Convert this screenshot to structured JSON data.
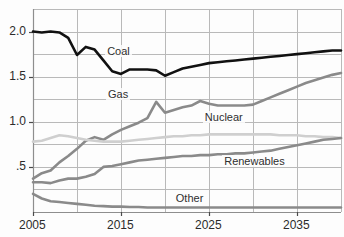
{
  "chart_data": {
    "type": "line",
    "title": "",
    "subtitle": "",
    "xlabel": "",
    "ylabel": "",
    "xlim": [
      2005,
      2040
    ],
    "ylim": [
      0,
      2.25
    ],
    "grid": true,
    "grid_x_step": 5,
    "grid_y_step": 0.25,
    "legend_position": "inline-annotations",
    "x_ticks": [
      2005,
      2015,
      2025,
      2035
    ],
    "x_tick_labels": [
      "2005",
      "2015",
      "2025",
      "2035"
    ],
    "x_minor_gridlines": [
      2010,
      2020,
      2030,
      2040
    ],
    "y_ticks": [
      0.5,
      1.0,
      1.5,
      2.0
    ],
    "y_tick_labels": [
      ".5",
      "1.0",
      "1.5",
      "2.0"
    ],
    "x": [
      2005,
      2006,
      2007,
      2008,
      2009,
      2010,
      2011,
      2012,
      2013,
      2014,
      2015,
      2016,
      2017,
      2018,
      2019,
      2020,
      2021,
      2022,
      2023,
      2024,
      2025,
      2026,
      2027,
      2028,
      2029,
      2030,
      2031,
      2032,
      2033,
      2034,
      2035,
      2036,
      2037,
      2038,
      2039,
      2040
    ],
    "series": [
      {
        "name": "Coal",
        "color": "#111111",
        "width": 2.6,
        "label_x": 2013.2,
        "label_y": 1.79,
        "values": [
          2.0,
          1.99,
          2.0,
          1.99,
          1.93,
          1.74,
          1.83,
          1.8,
          1.68,
          1.56,
          1.53,
          1.58,
          1.58,
          1.58,
          1.57,
          1.51,
          1.55,
          1.59,
          1.61,
          1.63,
          1.65,
          1.66,
          1.67,
          1.68,
          1.69,
          1.7,
          1.71,
          1.72,
          1.73,
          1.74,
          1.75,
          1.76,
          1.77,
          1.78,
          1.79,
          1.79
        ]
      },
      {
        "name": "Gas",
        "color": "#8a8a8a",
        "width": 2.6,
        "label_x": 2013.3,
        "label_y": 1.31,
        "values": [
          0.37,
          0.43,
          0.46,
          0.55,
          0.62,
          0.7,
          0.79,
          0.83,
          0.8,
          0.86,
          0.91,
          0.95,
          0.99,
          1.04,
          1.22,
          1.1,
          1.13,
          1.16,
          1.18,
          1.23,
          1.2,
          1.18,
          1.18,
          1.18,
          1.18,
          1.19,
          1.23,
          1.27,
          1.31,
          1.35,
          1.39,
          1.43,
          1.46,
          1.49,
          1.52,
          1.54
        ]
      },
      {
        "name": "Nuclear",
        "color": "#cfcfcf",
        "width": 2.6,
        "label_x": 2024.3,
        "label_y": 1.05,
        "values": [
          0.78,
          0.79,
          0.82,
          0.85,
          0.84,
          0.82,
          0.8,
          0.79,
          0.78,
          0.78,
          0.78,
          0.79,
          0.8,
          0.81,
          0.82,
          0.83,
          0.84,
          0.84,
          0.85,
          0.85,
          0.86,
          0.86,
          0.86,
          0.86,
          0.86,
          0.86,
          0.86,
          0.86,
          0.85,
          0.85,
          0.85,
          0.84,
          0.84,
          0.83,
          0.83,
          0.82
        ]
      },
      {
        "name": "Renewables",
        "color": "#8a8a8a",
        "width": 2.6,
        "label_x": 2026.5,
        "label_y": 0.57,
        "values": [
          0.33,
          0.33,
          0.32,
          0.35,
          0.37,
          0.37,
          0.39,
          0.42,
          0.5,
          0.51,
          0.53,
          0.55,
          0.57,
          0.58,
          0.59,
          0.6,
          0.61,
          0.62,
          0.62,
          0.63,
          0.63,
          0.64,
          0.64,
          0.65,
          0.65,
          0.66,
          0.67,
          0.68,
          0.7,
          0.72,
          0.74,
          0.76,
          0.78,
          0.8,
          0.81,
          0.82
        ]
      },
      {
        "name": "Other",
        "color": "#8a8a8a",
        "width": 2.6,
        "label_x": 2021.0,
        "label_y": 0.16,
        "values": [
          0.2,
          0.15,
          0.12,
          0.11,
          0.1,
          0.09,
          0.08,
          0.07,
          0.065,
          0.06,
          0.06,
          0.055,
          0.055,
          0.05,
          0.05,
          0.05,
          0.05,
          0.05,
          0.05,
          0.05,
          0.05,
          0.05,
          0.05,
          0.05,
          0.05,
          0.05,
          0.05,
          0.05,
          0.05,
          0.05,
          0.05,
          0.05,
          0.05,
          0.05,
          0.05,
          0.05
        ]
      }
    ]
  },
  "axis": {
    "grid_color": "#b9b9b9",
    "axis_color": "#8e8e8e",
    "background": "#fdfdfd"
  }
}
